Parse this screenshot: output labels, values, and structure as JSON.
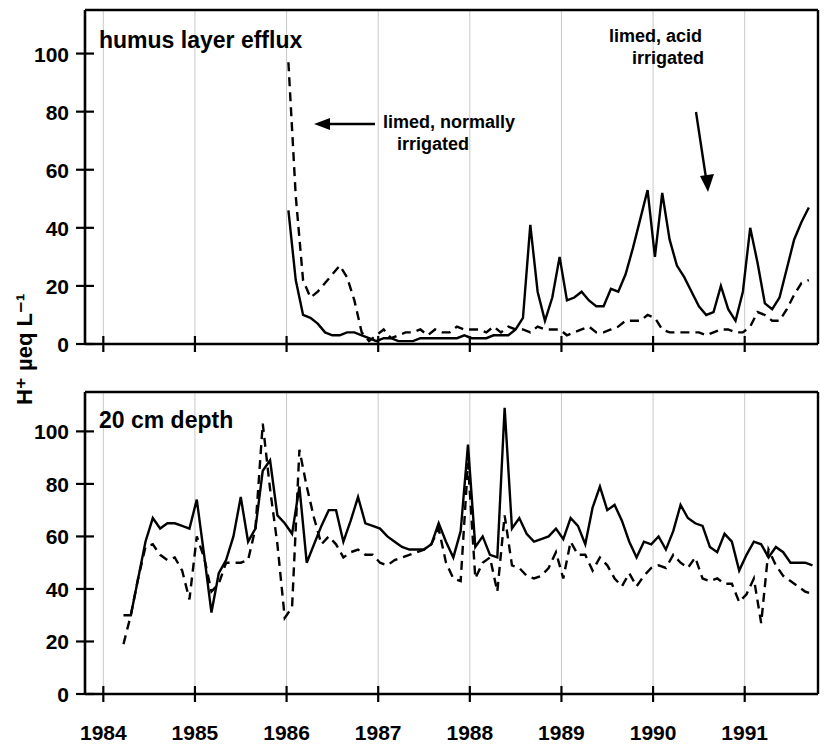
{
  "figure": {
    "y_axis_title": "H⁺ µeq L⁻¹",
    "panels": [
      {
        "id": "humus",
        "title": "humus layer efflux",
        "annotations": [
          {
            "id": "limed-normally-irrigated",
            "line1": "limed, normally",
            "line2": "irrigated"
          },
          {
            "id": "limed-acid-irrigated",
            "line1": "limed, acid",
            "line2": "irrigated"
          }
        ]
      },
      {
        "id": "depth20",
        "title": "20 cm depth"
      }
    ],
    "x_tick_labels": [
      "1984",
      "1985",
      "1986",
      "1987",
      "1988",
      "1989",
      "1990",
      "1991"
    ],
    "y_tick_labels_top": [
      "0",
      "20",
      "40",
      "60",
      "80",
      "100"
    ],
    "y_tick_labels_bottom": [
      "0",
      "20",
      "40",
      "60",
      "80",
      "100"
    ]
  },
  "chart_data": {
    "type": "line",
    "xlabel": "",
    "ylabel": "H+ µeq L-1",
    "grid": true,
    "legend_position": "inline-annotations",
    "xlim": [
      1983.8,
      1991.8
    ],
    "x_ticks": [
      1984,
      1985,
      1986,
      1987,
      1988,
      1989,
      1990,
      1991
    ],
    "panels": [
      {
        "name": "humus layer efflux",
        "ylim": [
          0,
          115
        ],
        "y_ticks": [
          0,
          20,
          40,
          60,
          80,
          100
        ],
        "annotations": [
          {
            "text": "limed, normally irrigated",
            "points_to_series": "limed, normally irrigated (dashed)",
            "x": 1986.0,
            "y": 78
          },
          {
            "text": "limed, acid irrigated",
            "points_to_series": "limed, acid irrigated (solid)",
            "x": 1990.1,
            "y": 53
          }
        ],
        "series": [
          {
            "name": "limed, acid irrigated",
            "style": "solid",
            "x": [
              1986.02,
              1986.1,
              1986.18,
              1986.26,
              1986.34,
              1986.42,
              1986.5,
              1986.58,
              1986.66,
              1986.74,
              1986.82,
              1986.9,
              1986.98,
              1987.06,
              1987.14,
              1987.22,
              1987.3,
              1987.38,
              1987.46,
              1987.54,
              1987.62,
              1987.7,
              1987.78,
              1987.86,
              1987.94,
              1988.02,
              1988.1,
              1988.18,
              1988.26,
              1988.34,
              1988.42,
              1988.5,
              1988.58,
              1988.66,
              1988.74,
              1988.82,
              1988.9,
              1988.98,
              1989.06,
              1989.14,
              1989.22,
              1989.3,
              1989.38,
              1989.46,
              1989.54,
              1989.62,
              1989.7,
              1989.78,
              1989.86,
              1989.94,
              1990.02,
              1990.1,
              1990.18,
              1990.26,
              1990.34,
              1990.42,
              1990.5,
              1990.58,
              1990.66,
              1990.74,
              1990.82,
              1990.9,
              1990.98,
              1991.06,
              1991.14,
              1991.22,
              1991.3,
              1991.38,
              1991.46,
              1991.54,
              1991.62,
              1991.7
            ],
            "y": [
              46,
              22,
              10,
              9,
              7,
              4,
              3,
              3,
              4,
              4,
              3,
              2,
              1,
              2,
              2,
              1,
              1,
              1,
              2,
              2,
              2,
              2,
              2,
              2,
              3,
              2,
              2,
              2,
              3,
              3,
              3,
              5,
              9,
              41,
              18,
              8,
              16,
              30,
              15,
              16,
              18,
              15,
              13,
              13,
              19,
              18,
              24,
              33,
              43,
              53,
              30,
              52,
              36,
              27,
              23,
              18,
              13,
              10,
              11,
              20,
              12,
              8,
              18,
              40,
              28,
              14,
              12,
              16,
              26,
              36,
              42,
              47
            ]
          },
          {
            "name": "limed, normally irrigated",
            "style": "dashed",
            "x": [
              1986.02,
              1986.1,
              1986.18,
              1986.26,
              1986.34,
              1986.42,
              1986.5,
              1986.58,
              1986.66,
              1986.74,
              1986.82,
              1986.9,
              1986.98,
              1987.06,
              1987.14,
              1987.22,
              1987.3,
              1987.38,
              1987.46,
              1987.54,
              1987.62,
              1987.7,
              1987.78,
              1987.86,
              1987.94,
              1988.02,
              1988.1,
              1988.18,
              1988.26,
              1988.34,
              1988.42,
              1988.5,
              1988.58,
              1988.66,
              1988.74,
              1988.82,
              1988.9,
              1988.98,
              1989.06,
              1989.14,
              1989.22,
              1989.3,
              1989.38,
              1989.46,
              1989.54,
              1989.62,
              1989.7,
              1989.78,
              1989.86,
              1989.94,
              1990.02,
              1990.1,
              1990.18,
              1990.26,
              1990.34,
              1990.42,
              1990.5,
              1990.58,
              1990.66,
              1990.74,
              1990.82,
              1990.9,
              1990.98,
              1991.06,
              1991.14,
              1991.22,
              1991.3,
              1991.38,
              1991.46,
              1991.54,
              1991.62,
              1991.7
            ],
            "y": [
              97,
              51,
              22,
              16,
              18,
              21,
              24,
              27,
              23,
              15,
              4,
              1,
              3,
              5,
              2,
              3,
              4,
              4,
              5,
              3,
              5,
              4,
              4,
              6,
              5,
              5,
              5,
              4,
              6,
              4,
              6,
              5,
              5,
              4,
              6,
              5,
              5,
              5,
              3,
              4,
              5,
              6,
              4,
              4,
              5,
              6,
              8,
              8,
              8,
              10,
              9,
              5,
              4,
              4,
              4,
              4,
              4,
              3,
              4,
              5,
              5,
              4,
              4,
              6,
              11,
              10,
              8,
              8,
              12,
              17,
              21,
              22
            ]
          }
        ]
      },
      {
        "name": "20 cm depth",
        "ylim": [
          0,
          115
        ],
        "y_ticks": [
          0,
          20,
          40,
          60,
          80,
          100
        ],
        "series": [
          {
            "name": "limed, acid irrigated",
            "style": "solid",
            "x": [
              1984.22,
              1984.3,
              1984.38,
              1984.46,
              1984.54,
              1984.62,
              1984.7,
              1984.78,
              1984.86,
              1984.94,
              1985.02,
              1985.1,
              1985.18,
              1985.26,
              1985.34,
              1985.42,
              1985.5,
              1985.58,
              1985.66,
              1985.74,
              1985.82,
              1985.9,
              1985.98,
              1986.06,
              1986.14,
              1986.22,
              1986.3,
              1986.38,
              1986.46,
              1986.54,
              1986.62,
              1986.7,
              1986.78,
              1986.86,
              1986.94,
              1987.02,
              1987.1,
              1987.18,
              1987.26,
              1987.34,
              1987.42,
              1987.5,
              1987.58,
              1987.66,
              1987.74,
              1987.82,
              1987.9,
              1987.98,
              1988.06,
              1988.14,
              1988.22,
              1988.3,
              1988.38,
              1988.46,
              1988.54,
              1988.62,
              1988.7,
              1988.78,
              1988.86,
              1988.94,
              1989.02,
              1989.1,
              1989.18,
              1989.26,
              1989.34,
              1989.42,
              1989.5,
              1989.58,
              1989.66,
              1989.74,
              1989.82,
              1989.9,
              1989.98,
              1990.06,
              1990.14,
              1990.22,
              1990.3,
              1990.38,
              1990.46,
              1990.54,
              1990.62,
              1990.7,
              1990.78,
              1990.86,
              1990.94,
              1991.02,
              1991.1,
              1991.18,
              1991.26,
              1991.34,
              1991.42,
              1991.5,
              1991.58,
              1991.66,
              1991.74
            ],
            "y": [
              30,
              30,
              44,
              58,
              67,
              63,
              65,
              65,
              64,
              63,
              74,
              53,
              31,
              46,
              51,
              60,
              75,
              58,
              63,
              85,
              89,
              68,
              65,
              61,
              79,
              50,
              57,
              64,
              70,
              70,
              58,
              66,
              75,
              65,
              64,
              63,
              60,
              58,
              56,
              55,
              55,
              55,
              57,
              65,
              58,
              52,
              62,
              95,
              56,
              60,
              53,
              52,
              109,
              63,
              67,
              61,
              58,
              59,
              60,
              63,
              59,
              67,
              64,
              57,
              71,
              79,
              70,
              72,
              66,
              58,
              52,
              58,
              57,
              60,
              55,
              62,
              72,
              67,
              65,
              64,
              56,
              54,
              61,
              58,
              47,
              53,
              58,
              57,
              52,
              56,
              54,
              50,
              50,
              50,
              49
            ]
          },
          {
            "name": "limed, normally irrigated",
            "style": "dashed",
            "x": [
              1984.22,
              1984.3,
              1984.38,
              1984.46,
              1984.54,
              1984.62,
              1984.7,
              1984.78,
              1984.86,
              1984.94,
              1985.02,
              1985.1,
              1985.18,
              1985.26,
              1985.34,
              1985.42,
              1985.5,
              1985.58,
              1985.66,
              1985.74,
              1985.82,
              1985.9,
              1985.98,
              1986.06,
              1986.14,
              1986.22,
              1986.3,
              1986.38,
              1986.46,
              1986.54,
              1986.62,
              1986.7,
              1986.78,
              1986.86,
              1986.94,
              1987.02,
              1987.1,
              1987.18,
              1987.26,
              1987.34,
              1987.42,
              1987.5,
              1987.58,
              1987.66,
              1987.74,
              1987.82,
              1987.9,
              1987.98,
              1988.06,
              1988.14,
              1988.22,
              1988.3,
              1988.38,
              1988.46,
              1988.54,
              1988.62,
              1988.7,
              1988.78,
              1988.86,
              1988.94,
              1989.02,
              1989.1,
              1989.18,
              1989.26,
              1989.34,
              1989.42,
              1989.5,
              1989.58,
              1989.66,
              1989.74,
              1989.82,
              1989.9,
              1989.98,
              1990.06,
              1990.14,
              1990.22,
              1990.3,
              1990.38,
              1990.46,
              1990.54,
              1990.62,
              1990.7,
              1990.78,
              1990.86,
              1990.94,
              1991.02,
              1991.1,
              1991.18,
              1991.26,
              1991.34,
              1991.42,
              1991.5,
              1991.58,
              1991.66,
              1991.74
            ],
            "y": [
              19,
              30,
              44,
              56,
              57,
              53,
              51,
              52,
              47,
              36,
              60,
              52,
              39,
              42,
              50,
              50,
              50,
              51,
              63,
              103,
              78,
              57,
              29,
              33,
              93,
              79,
              67,
              57,
              60,
              57,
              52,
              54,
              55,
              53,
              53,
              50,
              49,
              51,
              52,
              53,
              54,
              55,
              57,
              63,
              50,
              44,
              43,
              88,
              44,
              50,
              52,
              39,
              68,
              49,
              48,
              45,
              44,
              45,
              48,
              54,
              44,
              58,
              53,
              53,
              47,
              52,
              49,
              44,
              41,
              46,
              41,
              45,
              48,
              49,
              48,
              53,
              50,
              48,
              52,
              44,
              43,
              44,
              42,
              42,
              35,
              38,
              44,
              27,
              55,
              49,
              45,
              43,
              41,
              39,
              38
            ]
          }
        ]
      }
    ]
  }
}
